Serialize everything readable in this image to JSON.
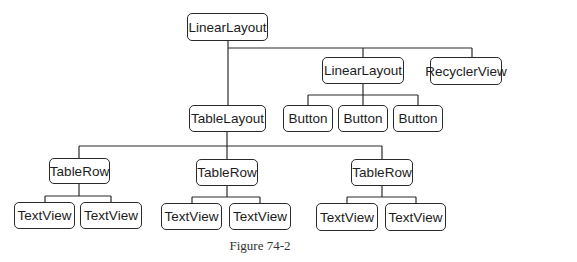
{
  "caption": "Figure 74-2",
  "nodes": {
    "root": "LinearLayout",
    "linear2": "LinearLayout",
    "recycler": "RecyclerView",
    "table": "TableLayout",
    "button1": "Button",
    "button2": "Button",
    "button3": "Button",
    "row1": "TableRow",
    "row2": "TableRow",
    "row3": "TableRow",
    "tv1": "TextView",
    "tv2": "TextView",
    "tv3": "TextView",
    "tv4": "TextView",
    "tv5": "TextView",
    "tv6": "TextView"
  },
  "colors": {
    "stroke": "#2a2a2a",
    "text": "#1c1c1c",
    "background": "#ffffff"
  }
}
